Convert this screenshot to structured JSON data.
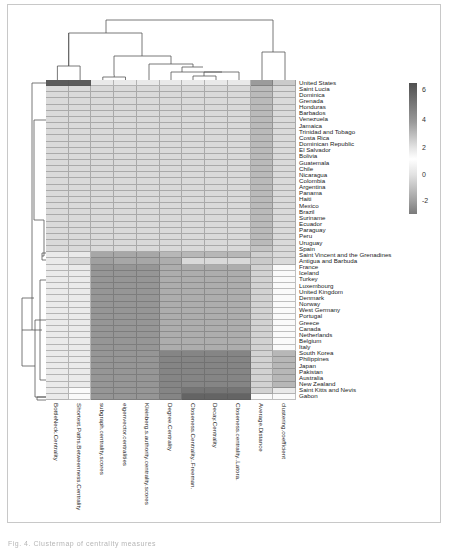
{
  "chart_data": {
    "type": "heatmap",
    "subtype": "clustermap",
    "title": "",
    "xlabel": "",
    "ylabel": "",
    "columns": [
      "BottleNeck.Centrality",
      "Shortest.Paths.Betweenness.Centrality",
      "subgraph.centrality.scores",
      "eigenvector.centralities",
      "Kleinberg.s.authority.centrality.scores",
      "Degree.Centrality",
      "Closeness.Centrality..Freeman.",
      "Decay.Centrality",
      "Closeness.centrality..Latora.",
      "Average.Distance",
      "clustering.coefficient"
    ],
    "rows": [
      "United States",
      "Saint Lucia",
      "Dominica",
      "Grenada",
      "Honduras",
      "Barbados",
      "Venezuela",
      "Jamaica",
      "Trinidad and Tobago",
      "Costa Rica",
      "Dominican Republic",
      "El Salvador",
      "Bolivia",
      "Guatemala",
      "Chile",
      "Nicaragua",
      "Colombia",
      "Argentina",
      "Panama",
      "Haiti",
      "Mexico",
      "Brazil",
      "Suriname",
      "Ecuador",
      "Paraguay",
      "Peru",
      "Uruguay",
      "Spain",
      "Saint Vincent and the Grenadines",
      "Antigua and Barbuda",
      "France",
      "Iceland",
      "Turkey",
      "Luxembourg",
      "United Kingdom",
      "Denmark",
      "Norway",
      "West Germany",
      "Portugal",
      "Greece",
      "Canada",
      "Netherlands",
      "Belgium",
      "Italy",
      "South Korea",
      "Philippines",
      "Japan",
      "Pakistan",
      "Australia",
      "New Zealand",
      "Saint Kitts and Nevis",
      "Gabon"
    ],
    "values_approx": {
      "United States": [
        6.5,
        6.5,
        1.0,
        1.0,
        1.0,
        1.0,
        1.0,
        1.0,
        1.0,
        4.5,
        3.0
      ],
      "latin_caribbean_group": [
        2.5,
        2.5,
        0.5,
        0.5,
        0.5,
        0.5,
        0.5,
        0.5,
        0.5,
        3.5,
        2.5
      ],
      "Spain": [
        2.5,
        2.5,
        0.5,
        0.5,
        0.5,
        0.5,
        0.5,
        0.5,
        0.5,
        3.2,
        2.5
      ],
      "Saint Vincent and the Grenadines": [
        2.0,
        2.0,
        -1.0,
        -1.0,
        -1.0,
        -0.5,
        -0.5,
        -0.5,
        -0.5,
        0.2,
        2.5
      ],
      "Antigua and Barbuda": [
        2.0,
        0.5,
        -1.2,
        -1.0,
        -1.0,
        -0.8,
        0.5,
        0.5,
        0.5,
        3.0,
        2.5
      ],
      "europe_group": [
        2.0,
        2.0,
        -1.5,
        -1.5,
        -1.5,
        -0.8,
        -0.8,
        -0.8,
        -0.8,
        0.3,
        1.5
      ],
      "asia_pacific_group": [
        2.0,
        2.0,
        -1.5,
        -1.5,
        -1.5,
        -2.0,
        -2.0,
        -2.0,
        -2.0,
        0.3,
        -0.5
      ],
      "Saint Kitts and Nevis": [
        2.0,
        1.5,
        -1.5,
        -1.5,
        -1.5,
        -2.0,
        -2.5,
        -2.5,
        -2.5,
        0.3,
        1.0
      ],
      "Gabon": [
        2.0,
        1.5,
        -1.5,
        -1.5,
        -1.5,
        -2.0,
        -3.0,
        -3.0,
        -3.0,
        1.5,
        1.5
      ]
    },
    "colorbar": {
      "ticks": [
        6,
        4,
        2,
        0,
        -2
      ],
      "range": [
        -3,
        7
      ]
    },
    "legend_position": "top-right",
    "grid": true
  },
  "caption": "Fig. 4. Clustermap of centrality measures"
}
